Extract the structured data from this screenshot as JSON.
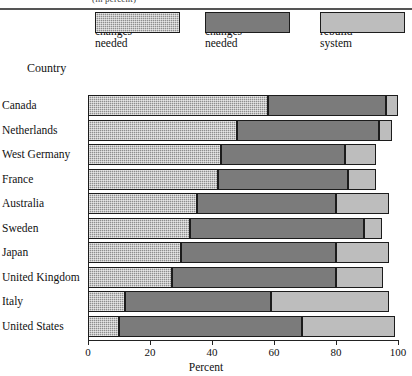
{
  "caption": "(in percent)",
  "legend": {
    "country_label": "Country",
    "entries": [
      {
        "label": "Minor\nchanges\nneeded",
        "color": "#8e8e8e",
        "swatch_name": "legend-swatch-minor"
      },
      {
        "label": "Fundamental\nchanges\nneeded",
        "color": "#7b7b7b",
        "swatch_name": "legend-swatch-fundamental"
      },
      {
        "label": "Completely\nrebuild\nsystem",
        "color": "#bdbdbd",
        "swatch_name": "legend-swatch-rebuild"
      }
    ]
  },
  "axis": {
    "title": "Percent",
    "ticks": [
      "0",
      "20",
      "40",
      "60",
      "80",
      "100"
    ],
    "min": 0,
    "max": 100
  },
  "chart_data": {
    "type": "bar",
    "orientation": "horizontal",
    "stacked": true,
    "title": "",
    "xlabel": "Percent",
    "ylabel": "Country",
    "xlim": [
      0,
      100
    ],
    "grid": false,
    "legend_position": "top",
    "categories": [
      "Canada",
      "Netherlands",
      "West Germany",
      "France",
      "Australia",
      "Sweden",
      "Japan",
      "United Kingdom",
      "Italy",
      "United States"
    ],
    "series": [
      {
        "name": "Minor changes needed",
        "color": "#8e8e8e",
        "values": [
          58,
          48,
          43,
          42,
          35,
          33,
          30,
          27,
          12,
          10
        ]
      },
      {
        "name": "Fundamental changes needed",
        "color": "#7b7b7b",
        "values": [
          38,
          46,
          40,
          42,
          45,
          56,
          50,
          53,
          47,
          59
        ]
      },
      {
        "name": "Completely rebuild system",
        "color": "#bdbdbd",
        "values": [
          4,
          4,
          10,
          9,
          17,
          6,
          17,
          15,
          38,
          30
        ]
      }
    ]
  }
}
